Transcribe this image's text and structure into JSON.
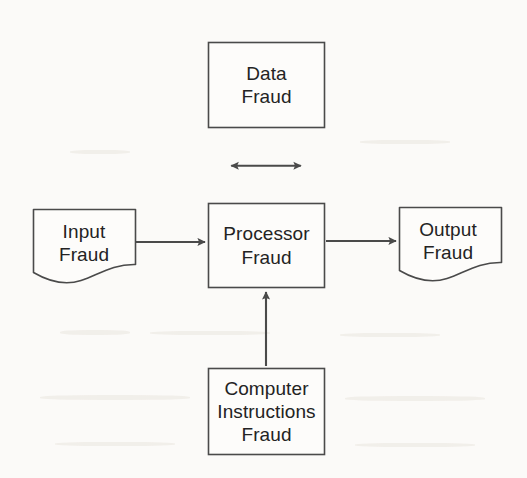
{
  "diagram": {
    "background_color": "#fbfaf8",
    "line_color": "#4a4a4a",
    "text_color": "#232323",
    "nodes": [
      {
        "id": "data-fraud",
        "shape": "rectangle",
        "lines": [
          "Data",
          "Fraud"
        ],
        "line1": "Data",
        "line2": "Fraud",
        "line3": "",
        "x": 208,
        "y": 42,
        "width": 117,
        "height": 86
      },
      {
        "id": "input-fraud",
        "shape": "document",
        "lines": [
          "Input",
          "Fraud"
        ],
        "line1": "Input",
        "line2": "Fraud",
        "line3": "",
        "x": 33,
        "y": 209,
        "width": 103,
        "height": 73
      },
      {
        "id": "processor-fraud",
        "shape": "rectangle",
        "lines": [
          "Processor",
          "Fraud"
        ],
        "line1": "Processor",
        "line2": "Fraud",
        "line3": "",
        "x": 208,
        "y": 203,
        "width": 117,
        "height": 85
      },
      {
        "id": "output-fraud",
        "shape": "document",
        "lines": [
          "Output",
          "Fraud"
        ],
        "line1": "Output",
        "line2": "Fraud",
        "line3": "",
        "x": 399,
        "y": 207,
        "width": 103,
        "height": 73
      },
      {
        "id": "computer-instructions-fraud",
        "shape": "rectangle",
        "lines": [
          "Computer",
          "Instructions",
          "Fraud"
        ],
        "line1": "Computer",
        "line2": "Instructions",
        "line3": "Fraud",
        "x": 208,
        "y": 368,
        "width": 117,
        "height": 87
      }
    ],
    "connectors": [
      {
        "id": "data-processor",
        "from": "processor-fraud",
        "to": "data-fraud",
        "direction": "bidirectional",
        "orientation": "vertical"
      },
      {
        "id": "input-processor",
        "from": "input-fraud",
        "to": "processor-fraud",
        "direction": "forward",
        "orientation": "horizontal"
      },
      {
        "id": "processor-output",
        "from": "processor-fraud",
        "to": "output-fraud",
        "direction": "forward",
        "orientation": "horizontal"
      },
      {
        "id": "instructions-processor",
        "from": "computer-instructions-fraud",
        "to": "processor-fraud",
        "direction": "forward",
        "orientation": "vertical"
      }
    ]
  }
}
